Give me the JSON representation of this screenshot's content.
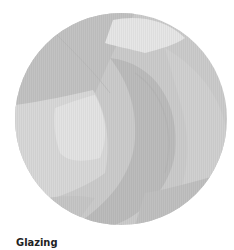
{
  "figure": {
    "caption": "Glazing",
    "colors": {
      "base": "#c9c9c9",
      "light": "#dedede",
      "lighter": "#e9e9e9",
      "mid": "#bdbdbd",
      "dark": "#b0b0b0",
      "caption_text": "#222222"
    }
  }
}
